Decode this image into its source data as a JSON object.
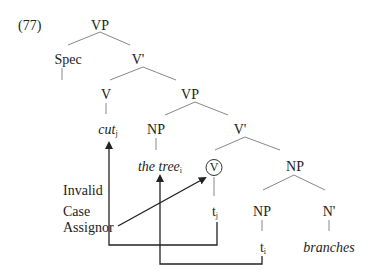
{
  "example_number": "(77)",
  "tree": {
    "root": "VP",
    "spec": "Spec",
    "vbar1": "V'",
    "v": "V",
    "vp2": "VP",
    "cut": "cut",
    "cut_index": "j",
    "np1": "NP",
    "vbar2": "V'",
    "the_tree": "the tree",
    "the_tree_index": "i",
    "v_circled": "V",
    "np2": "NP",
    "trace_j": "t",
    "trace_j_index": "j",
    "np3": "NP",
    "nbar": "N'",
    "trace_i": "t",
    "trace_i_index": "i",
    "branches": "branches"
  },
  "annotation": {
    "line1": "Invalid",
    "line2": "Case",
    "line3": "Assignor"
  },
  "colors": {
    "lines": "#777777",
    "arrows": "#222222"
  }
}
